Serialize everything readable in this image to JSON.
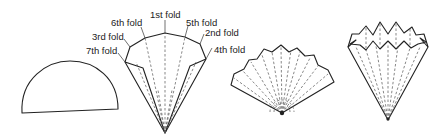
{
  "diagram": {
    "steps": [
      {
        "id": "step-1",
        "description": "Semicircle of paper"
      },
      {
        "id": "step-2",
        "description": "Folded into fan with labeled folds"
      },
      {
        "id": "step-3",
        "description": "Opened pleated fan"
      },
      {
        "id": "step-4",
        "description": "Pleated cone"
      }
    ],
    "fold_labels": {
      "first": "1st fold",
      "second": "2nd fold",
      "third": "3rd fold",
      "fourth": "4th fold",
      "fifth": "5th fold",
      "sixth": "6th fold",
      "seventh": "7th fold"
    },
    "colors": {
      "line": "#222222",
      "dashed": "#555555",
      "background": "#ffffff"
    }
  }
}
